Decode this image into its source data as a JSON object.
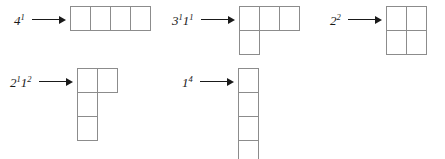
{
  "figure": {
    "ink_color": "#1a1a1a",
    "cell_border_color": "#8c8c8c",
    "background": "#ffffff"
  },
  "entries": [
    {
      "id": "partition-4-1",
      "label_base_1": "4",
      "label_exp_1": "1",
      "label_base_2": "",
      "label_exp_2": "",
      "label_text": "4^1",
      "partition": [
        4
      ],
      "rows": [
        4
      ],
      "total_cells": 4,
      "position": {
        "left": 14,
        "top": 6
      }
    },
    {
      "id": "partition-3-1-1-1",
      "label_base_1": "3",
      "label_exp_1": "1",
      "label_base_2": "1",
      "label_exp_2": "1",
      "label_text": "3^1 1^1",
      "partition": [
        3,
        1
      ],
      "rows": [
        3,
        1
      ],
      "total_cells": 4,
      "position": {
        "left": 172,
        "top": 6
      }
    },
    {
      "id": "partition-2-2",
      "label_base_1": "2",
      "label_exp_1": "2",
      "label_base_2": "",
      "label_exp_2": "",
      "label_text": "2^2",
      "partition": [
        2,
        2
      ],
      "rows": [
        2,
        2
      ],
      "total_cells": 4,
      "position": {
        "left": 330,
        "top": 6
      }
    },
    {
      "id": "partition-2-1-1-2",
      "label_base_1": "2",
      "label_exp_1": "1",
      "label_base_2": "1",
      "label_exp_2": "2",
      "label_text": "2^1 1^2",
      "partition": [
        2,
        1,
        1
      ],
      "rows": [
        2,
        1,
        1
      ],
      "total_cells": 4,
      "position": {
        "left": 10,
        "top": 68
      }
    },
    {
      "id": "partition-1-4",
      "label_base_1": "1",
      "label_exp_1": "4",
      "label_base_2": "",
      "label_exp_2": "",
      "label_text": "1^4",
      "partition": [
        1,
        1,
        1,
        1
      ],
      "rows": [
        1,
        1,
        1,
        1
      ],
      "total_cells": 4,
      "position": {
        "left": 182,
        "top": 68
      }
    }
  ]
}
